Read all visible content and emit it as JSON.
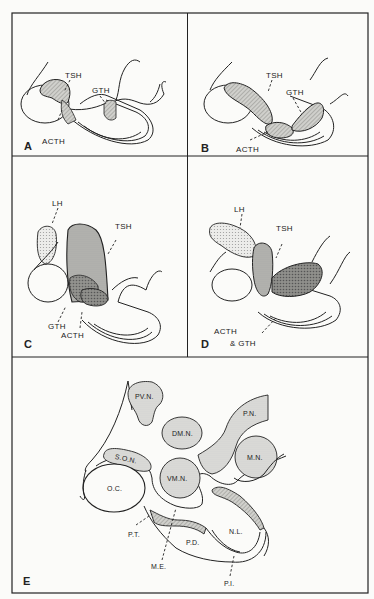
{
  "figure": {
    "panels": [
      {
        "id": "A",
        "letter": "A",
        "labels": {
          "tsh": "TSH",
          "gth": "GTH",
          "acth": "ACTH"
        }
      },
      {
        "id": "B",
        "letter": "B",
        "labels": {
          "tsh": "TSH",
          "gth": "GTH",
          "acth": "ACTH"
        }
      },
      {
        "id": "C",
        "letter": "C",
        "labels": {
          "lh": "LH",
          "tsh": "TSH",
          "gth": "GTH",
          "acth": "ACTH"
        }
      },
      {
        "id": "D",
        "letter": "D",
        "labels": {
          "lh": "LH",
          "tsh": "TSH",
          "acth": "ACTH",
          "gth": "& GTH"
        }
      },
      {
        "id": "E",
        "letter": "E",
        "labels": {
          "pvn": "PV.N.",
          "dmn": "DM.N.",
          "pn": "P.N.",
          "son": "S.O.N.",
          "vmn": "VM.N.",
          "mn": "M.N.",
          "oc": "O.C.",
          "pt": "P.T.",
          "pd": "P.D.",
          "nl": "N.L.",
          "me": "M.E.",
          "pi": "P.I."
        }
      }
    ],
    "colors": {
      "line": "#222222",
      "light_fill": "#dcdcd8",
      "medium_fill": "#b8b8b4",
      "dark_fill": "#8a8a86",
      "background": "#fbfbf9"
    }
  }
}
